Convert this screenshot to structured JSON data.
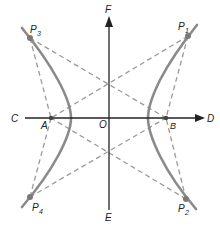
{
  "diagram": {
    "colors": {
      "axis": "#222222",
      "curve": "#8a8a8a",
      "dashed": "#9a9a9a",
      "point": "#7a7a7a",
      "label": "#222222"
    },
    "axes": {
      "horizontal": {
        "left_label": "C",
        "right_label": "D",
        "y": 118,
        "x1": 25,
        "x2": 205
      },
      "vertical": {
        "top_label": "F",
        "bottom_label": "E",
        "x": 109,
        "y1": 16,
        "y2": 210
      },
      "origin_label": "O"
    },
    "foci_points": [
      {
        "id": "A",
        "label": "A",
        "x": 51,
        "y": 118
      },
      {
        "id": "B",
        "label": "B",
        "x": 166,
        "y": 118
      }
    ],
    "curve_points": [
      {
        "id": "P1",
        "label": "P",
        "sub": "1",
        "x": 188,
        "y": 36
      },
      {
        "id": "P2",
        "label": "P",
        "sub": "2",
        "x": 186,
        "y": 199
      },
      {
        "id": "P3",
        "label": "P",
        "sub": "3",
        "x": 30,
        "y": 38
      },
      {
        "id": "P4",
        "label": "P",
        "sub": "4",
        "x": 30,
        "y": 197
      }
    ],
    "dashed_lines": [
      [
        "P3",
        "B"
      ],
      [
        "P3",
        "A"
      ],
      [
        "P1",
        "A"
      ],
      [
        "P1",
        "B"
      ],
      [
        "P4",
        "B"
      ],
      [
        "P4",
        "A"
      ],
      [
        "P2",
        "A"
      ],
      [
        "P2",
        "B"
      ]
    ]
  }
}
